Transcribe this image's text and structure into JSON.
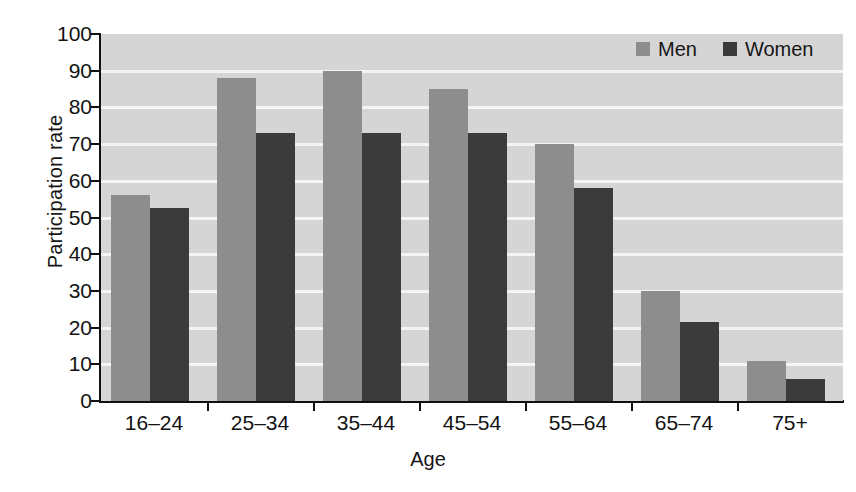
{
  "chart_data": {
    "type": "bar",
    "title": "",
    "xlabel": "Age",
    "ylabel": "Participation rate",
    "categories": [
      "16–24",
      "25–34",
      "35–44",
      "45–54",
      "55–64",
      "65–74",
      "75+"
    ],
    "series": [
      {
        "name": "Men",
        "color": "#8d8d8d",
        "values": [
          56,
          88,
          90,
          85,
          70,
          30,
          11
        ]
      },
      {
        "name": "Women",
        "color": "#3b3b3b",
        "values": [
          52.5,
          73,
          73,
          73,
          58,
          21.5,
          6
        ]
      }
    ],
    "ylim": [
      0,
      100
    ],
    "yticks": [
      0,
      10,
      20,
      30,
      40,
      50,
      60,
      70,
      80,
      90,
      100
    ],
    "ytick_labels": [
      "0",
      "10",
      "20",
      "30",
      "40",
      "50",
      "60",
      "70",
      "80",
      "90",
      "100"
    ],
    "grid": true,
    "grid_axis": "y",
    "grid_color": "#f4f4f4",
    "plot_background": "#d5d5d5",
    "figure_background": "#ffffff",
    "legend_position": "top-right",
    "legend_entries": [
      "Men",
      "Women"
    ]
  },
  "axes": {
    "y_title": "Participation rate",
    "x_title": "Age"
  }
}
